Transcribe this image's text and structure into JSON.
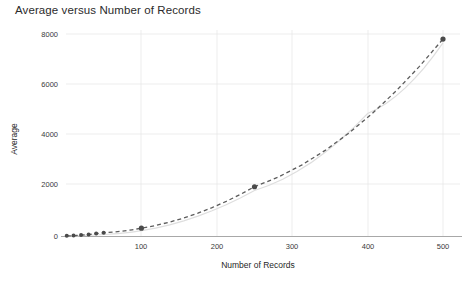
{
  "chart_data": {
    "type": "line",
    "title": "Average versus Number of Records",
    "xlabel": "Number of Records",
    "ylabel": "Average",
    "xlim": [
      0,
      520
    ],
    "ylim": [
      0,
      8400
    ],
    "xticks": [
      100,
      200,
      300,
      400,
      500
    ],
    "xtick_labels": [
      "100",
      "200",
      "300",
      "400",
      "500"
    ],
    "yticks": [
      0,
      2000,
      4000,
      6000,
      8000
    ],
    "ytick_labels": [
      "0",
      "2000",
      "4000",
      "6000",
      "8000"
    ],
    "grid": true,
    "legend": "none",
    "series": [
      {
        "name": "Average",
        "style": "dashed-with-markers",
        "color": "#4a4a4a",
        "x": [
          1,
          10,
          20,
          30,
          40,
          50,
          100,
          250,
          500
        ],
        "y": [
          5,
          15,
          35,
          60,
          95,
          130,
          310,
          1950,
          7800
        ]
      },
      {
        "name": "Trend",
        "style": "solid-light",
        "color": "#dedede",
        "x": [
          1,
          50,
          100,
          250,
          400,
          500
        ],
        "y": [
          0,
          60,
          210,
          1800,
          4850,
          7650
        ]
      }
    ]
  },
  "labels": {
    "title": "Average versus Number of Records",
    "xlabel": "Number of Records",
    "ylabel": "Average",
    "y_0": "0",
    "y_2000": "2000",
    "y_4000": "4000",
    "y_6000": "6000",
    "y_8000": "8000",
    "x_100": "100",
    "x_200": "200",
    "x_300": "300",
    "x_400": "400",
    "x_500": "500"
  }
}
